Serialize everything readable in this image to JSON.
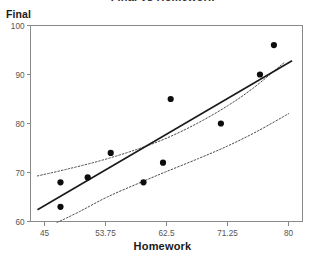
{
  "chart_data": {
    "type": "scatter",
    "title": "",
    "xlabel": "Homework",
    "ylabel": "Final",
    "xlim": [
      43.0,
      82.0
    ],
    "ylim": [
      60,
      100
    ],
    "xticks": [
      "45",
      "53.75",
      "62.5",
      "71.25",
      "80"
    ],
    "xtick_values": [
      45,
      53.75,
      62.5,
      71.25,
      80
    ],
    "yticks": [
      "100",
      "90",
      "80",
      "70",
      "60"
    ],
    "ytick_values": [
      100,
      90,
      80,
      70,
      60
    ],
    "grid": false,
    "legend": "none",
    "point_color": "#0d0d0d",
    "line_color": "#1a1a1a",
    "band_color": "#4a4a4a",
    "series": [
      {
        "name": "observations",
        "x": [
          47.3,
          47.3,
          51.2,
          54.5,
          59.2,
          62.0,
          63.1,
          70.3,
          75.9,
          77.9
        ],
        "y": [
          68,
          63,
          69,
          74,
          68,
          72,
          85,
          80,
          90,
          96
        ]
      }
    ],
    "fit_line": {
      "name": "least-squares regression line",
      "x": [
        44.0,
        80.5
      ],
      "y": [
        62.4,
        92.8
      ]
    },
    "confidence_band_upper": {
      "name": "upper confidence limit",
      "x": [
        44.0,
        48.0,
        53.0,
        58.0,
        62.5,
        67.0,
        71.25,
        75.0,
        79.5
      ],
      "y": [
        69.3,
        70.6,
        72.4,
        74.6,
        77.0,
        80.1,
        83.6,
        87.3,
        92.6
      ]
    },
    "confidence_band_lower": {
      "name": "lower confidence limit",
      "x": [
        46.8,
        50.0,
        54.0,
        58.5,
        62.5,
        67.0,
        71.25,
        75.5,
        80.0
      ],
      "y": [
        59.8,
        62.0,
        65.0,
        67.8,
        70.2,
        72.8,
        75.4,
        78.4,
        82.0
      ]
    }
  },
  "labels": {
    "title_fragment": "Final vs Homework",
    "ylabel": "Final",
    "xlabel": "Homework"
  }
}
